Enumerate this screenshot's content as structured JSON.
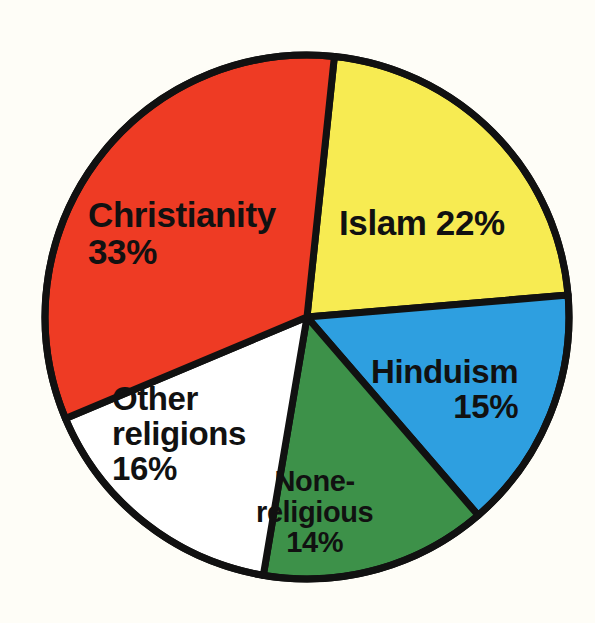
{
  "chart_data": {
    "type": "pie",
    "title": "",
    "subtitle": "",
    "xlabel": "",
    "ylabel": "",
    "legend_position": "none",
    "grid": false,
    "units": "percent",
    "total": 100,
    "start_angle_deg": 6,
    "direction": "clockwise",
    "background_color": "#fefdf7",
    "stroke_color": "#111111",
    "stroke_width": 7,
    "center": {
      "x": 307,
      "y": 317
    },
    "radius": 262,
    "categories": [
      "Islam",
      "Hinduism",
      "None-religious",
      "Other religions",
      "Christianity"
    ],
    "values": [
      22,
      15,
      14,
      16,
      33
    ],
    "colors": [
      "#f7eb52",
      "#2e9fe0",
      "#3d9149",
      "#ffffff",
      "#ee3b24"
    ],
    "slices": [
      {
        "name": "Islam",
        "value": 22,
        "value_text": "22%",
        "color": "#f7eb52",
        "label_lines": [
          "Islam 22%"
        ]
      },
      {
        "name": "Hinduism",
        "value": 15,
        "value_text": "15%",
        "color": "#2e9fe0",
        "label_lines": [
          "Hinduism",
          "15%"
        ]
      },
      {
        "name": "None-religious",
        "value": 14,
        "value_text": "14%",
        "color": "#3d9149",
        "label_lines": [
          "None-",
          "religious",
          "14%"
        ]
      },
      {
        "name": "Other religions",
        "value": 16,
        "value_text": "16%",
        "color": "#ffffff",
        "label_lines": [
          "Other",
          "religions",
          "16%"
        ]
      },
      {
        "name": "Christianity",
        "value": 33,
        "value_text": "33%",
        "color": "#ee3b24",
        "label_lines": [
          "Christianity",
          "33%"
        ]
      }
    ]
  },
  "labels": {
    "christianity": {
      "line1": "Christianity",
      "line2": "33%"
    },
    "islam": {
      "line1": "Islam 22%"
    },
    "hinduism": {
      "line1": "Hinduism",
      "line2": "15%"
    },
    "nonreligious": {
      "line1": "None-",
      "line2": "religious",
      "line3": "14%"
    },
    "other": {
      "line1": "Other",
      "line2": "religions",
      "line3": "16%"
    }
  }
}
